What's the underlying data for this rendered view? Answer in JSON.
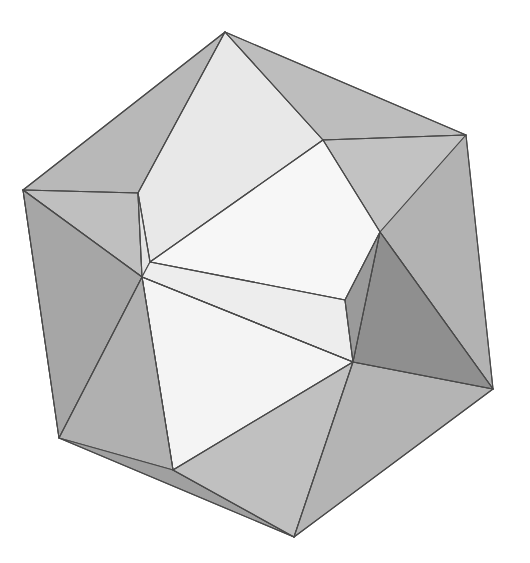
{
  "scene": {
    "title": "Polyhedron 3D Render",
    "subject_name": "convex-polyhedron",
    "background_color": "#ffffff",
    "canvas": {
      "width": 530,
      "height": 563
    },
    "edge_color": "#4a4a4a",
    "edge_width": 1.1,
    "shading": "flat",
    "palette": {
      "highlight": "#f7f7f7",
      "light": "#ededed",
      "light_mid": "#e2e2e2",
      "mid": "#d6d6d6",
      "mid_gray": "#c6c6c6",
      "gray": "#b6b6b6",
      "gray_dark": "#a8a8a8",
      "dark": "#9a9a9a",
      "darker": "#8d8d8d",
      "darkest": "#838383"
    }
  },
  "vertices": {
    "top_apex": [
      225,
      32
    ],
    "upper_left_outer": [
      23,
      190
    ],
    "upper_right_outer": [
      466,
      135
    ],
    "right_outer": [
      493,
      389
    ],
    "bottom_apex": [
      294,
      537
    ],
    "lower_left_outer": [
      59,
      438
    ],
    "inner_upper_left": [
      138,
      193
    ],
    "inner_left_mid": [
      142,
      277
    ],
    "inner_upper_right": [
      323,
      140
    ],
    "inner_right_low": [
      353,
      362
    ],
    "inner_bottom_left": [
      173,
      470
    ],
    "inner_center_left": [
      150,
      262
    ],
    "inner_center_right": [
      338,
      352
    ],
    "band_upper_left": [
      148,
      250
    ],
    "band_lower_right": [
      345,
      300
    ],
    "mid_left_edge": [
      146,
      268
    ],
    "mid_right_edge": [
      349,
      340
    ],
    "upper_band_right": [
      380,
      232
    ],
    "lower_band_left": [
      120,
      300
    ]
  },
  "faces": [
    {
      "name": "top-left-upper-facet",
      "fill": "#b8b8b8",
      "points": "225,32 23,190 138,193"
    },
    {
      "name": "top-left-sliver",
      "fill": "#bfbfbf",
      "points": "23,190 138,193 142,277"
    },
    {
      "name": "left-dark-wedge",
      "fill": "#8d8d8d",
      "points": "23,190 142,277 59,260"
    },
    {
      "name": "left-dark-lower",
      "fill": "#949494",
      "points": "23,190 59,260 59,438"
    },
    {
      "name": "left-outer-face",
      "fill": "#a6a6a6",
      "points": "23,190 59,438 142,277"
    },
    {
      "name": "top-crest-light",
      "fill": "#e8e8e8",
      "points": "225,32 138,193 150,262 323,140"
    },
    {
      "name": "top-right-facet",
      "fill": "#bdbdbd",
      "points": "225,32 323,140 466,135"
    },
    {
      "name": "right-upper-facet",
      "fill": "#c2c2c2",
      "points": "323,140 466,135 380,232"
    },
    {
      "name": "right-outer-upper",
      "fill": "#b2b2b2",
      "points": "466,135 380,232 493,389"
    },
    {
      "name": "right-outer-lower",
      "fill": "#a9a9a9",
      "points": "380,232 353,362 493,389"
    },
    {
      "name": "center-highlight-upper",
      "fill": "#f7f7f7",
      "points": "323,140 150,262 345,300 380,232"
    },
    {
      "name": "center-band-left",
      "fill": "#e4e4e4",
      "points": "138,193 150,262 142,277"
    },
    {
      "name": "center-band-strip",
      "fill": "#ededed",
      "points": "150,262 345,300 353,362 142,277"
    },
    {
      "name": "center-highlight-lower",
      "fill": "#f4f4f4",
      "points": "142,277 353,362 173,470"
    },
    {
      "name": "lower-left-light",
      "fill": "#eaeaea",
      "points": "142,277 173,470 130,430"
    },
    {
      "name": "bottom-left-facet",
      "fill": "#b0b0b0",
      "points": "59,438 142,277 173,470"
    },
    {
      "name": "bottom-left-rim",
      "fill": "#a0a0a0",
      "points": "59,438 173,470 294,537"
    },
    {
      "name": "bottom-center-facet",
      "fill": "#c0c0c0",
      "points": "173,470 353,362 294,537"
    },
    {
      "name": "bottom-right-facet",
      "fill": "#b4b4b4",
      "points": "353,362 493,389 294,537"
    },
    {
      "name": "right-dark-wedge",
      "fill": "#8f8f8f",
      "points": "353,362 380,232 493,389"
    },
    {
      "name": "right-dark-inner",
      "fill": "#9a9a9a",
      "points": "345,300 353,362 380,232"
    }
  ],
  "edges": [
    {
      "name": "edge-top-to-upperleft",
      "from": "top_apex",
      "to": "upper_left_outer"
    },
    {
      "name": "edge-top-to-innerUL",
      "from": "top_apex",
      "to": "inner_upper_left"
    },
    {
      "name": "edge-top-to-innerUR",
      "from": "top_apex",
      "to": "inner_upper_right"
    },
    {
      "name": "edge-top-to-upperright",
      "from": "top_apex",
      "to": "upper_right_outer"
    },
    {
      "name": "edge-UL-to-innerUL",
      "from": "upper_left_outer",
      "to": "inner_upper_left"
    },
    {
      "name": "edge-UL-to-innerLM",
      "from": "upper_left_outer",
      "to": "inner_left_mid"
    },
    {
      "name": "edge-UL-to-lowerleft",
      "from": "upper_left_outer",
      "to": "lower_left_outer"
    },
    {
      "name": "edge-innerUL-to-innerLM",
      "from": "inner_upper_left",
      "to": "inner_left_mid"
    },
    {
      "name": "edge-innerLM-to-lowerL",
      "from": "inner_left_mid",
      "to": "lower_left_outer"
    },
    {
      "name": "edge-innerLM-to-innerBL",
      "from": "inner_left_mid",
      "to": "inner_bottom_left"
    },
    {
      "name": "edge-innerLM-to-innerRL",
      "from": "inner_left_mid",
      "to": "inner_right_low"
    },
    {
      "name": "edge-lowerL-to-bottom",
      "from": "lower_left_outer",
      "to": "bottom_apex"
    },
    {
      "name": "edge-innerBL-to-bottom",
      "from": "inner_bottom_left",
      "to": "bottom_apex"
    },
    {
      "name": "edge-innerBL-to-innerRL",
      "from": "inner_bottom_left",
      "to": "inner_right_low"
    },
    {
      "name": "edge-innerRL-to-bottom",
      "from": "inner_right_low",
      "to": "bottom_apex"
    },
    {
      "name": "edge-innerRL-to-right",
      "from": "inner_right_low",
      "to": "right_outer"
    },
    {
      "name": "edge-right-to-bottom",
      "from": "right_outer",
      "to": "bottom_apex"
    },
    {
      "name": "edge-UR-to-right",
      "from": "upper_right_outer",
      "to": "right_outer"
    },
    {
      "name": "edge-innerUR-to-UR",
      "from": "inner_upper_right",
      "to": "upper_right_outer"
    },
    {
      "name": "edge-innerUR-to-band",
      "from": "inner_upper_right",
      "to": "upper_band_right"
    },
    {
      "name": "edge-band-to-right",
      "from": "upper_band_right",
      "to": "right_outer"
    },
    {
      "name": "edge-band-to-innerRL",
      "from": "upper_band_right",
      "to": "inner_right_low"
    },
    {
      "name": "edge-centerband-top",
      "from": "inner_center_left",
      "to": "band_lower_right"
    },
    {
      "name": "edge-centerband-bottom",
      "from": "inner_left_mid",
      "to": "inner_right_low"
    },
    {
      "name": "edge-innerUL-to-center",
      "from": "inner_upper_left",
      "to": "inner_center_left"
    },
    {
      "name": "edge-center-to-innerUR",
      "from": "inner_center_left",
      "to": "inner_upper_right"
    },
    {
      "name": "edge-bandlr-to-innerRL",
      "from": "band_lower_right",
      "to": "inner_right_low"
    },
    {
      "name": "edge-bandlr-to-bandur",
      "from": "band_lower_right",
      "to": "upper_band_right"
    }
  ]
}
